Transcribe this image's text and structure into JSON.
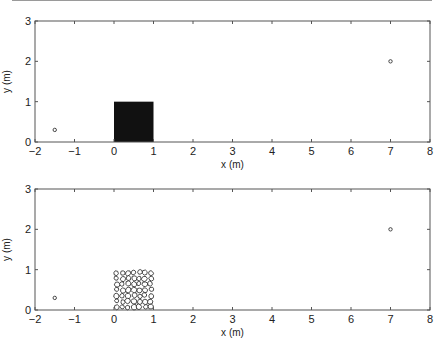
{
  "chart_data": [
    {
      "type": "scatter",
      "panel": "top",
      "title": "",
      "xlabel": "x (m)",
      "ylabel": "y (m)",
      "xlim": [
        -2,
        8
      ],
      "ylim": [
        0,
        3
      ],
      "xticks": [
        -2,
        -1,
        0,
        1,
        2,
        3,
        4,
        5,
        6,
        7,
        8
      ],
      "yticks": [
        0,
        1,
        2,
        3
      ],
      "grid": false,
      "legend": null,
      "points": [
        {
          "x": -1.5,
          "y": 0.3,
          "marker": "circle"
        },
        {
          "x": 7,
          "y": 2,
          "marker": "circle"
        }
      ],
      "shapes": [
        {
          "kind": "filled-rectangle",
          "x0": 0,
          "y0": 0,
          "x1": 1,
          "y1": 1,
          "fill": "#111111",
          "label": "solid block"
        }
      ]
    },
    {
      "type": "scatter",
      "panel": "bottom",
      "title": "",
      "xlabel": "x (m)",
      "ylabel": "y (m)",
      "xlim": [
        -2,
        8
      ],
      "ylim": [
        0,
        3
      ],
      "xticks": [
        -2,
        -1,
        0,
        1,
        2,
        3,
        4,
        5,
        6,
        7,
        8
      ],
      "yticks": [
        0,
        1,
        2,
        3
      ],
      "grid": false,
      "legend": null,
      "points": [
        {
          "x": -1.5,
          "y": 0.3,
          "marker": "circle"
        },
        {
          "x": 7,
          "y": 2,
          "marker": "circle"
        }
      ],
      "shapes": [
        {
          "kind": "particle-assembly",
          "x0": 0,
          "y0": 0,
          "x1": 1,
          "y1": 1,
          "fill": "none",
          "stroke": "#222222",
          "label": "packed irregular particles",
          "approx_rows": 7,
          "approx_cols": 7
        }
      ]
    }
  ],
  "labels": {
    "xlabel": "x (m)",
    "ylabel": "y (m)"
  },
  "colors": {
    "axis": "#555555",
    "block": "#111111",
    "particle_stroke": "#222222",
    "marker": "#333333"
  }
}
